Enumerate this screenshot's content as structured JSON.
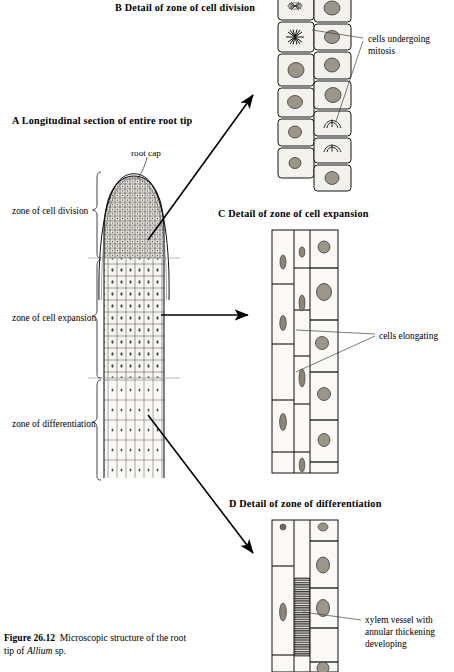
{
  "figure": {
    "caption_label": "Figure 26.12",
    "caption_text": "Microscopic structure of the root",
    "caption_text2": "tip of ",
    "caption_species": "Allium",
    "caption_text3": " sp."
  },
  "panels": {
    "a": {
      "heading": "A  Longitudinal section of entire root tip"
    },
    "b": {
      "heading": "B  Detail of zone of cell division"
    },
    "c": {
      "heading": "C  Detail of zone of cell expansion"
    },
    "d": {
      "heading": "D  Detail of zone of differentiation"
    }
  },
  "labels": {
    "root_cap": "root cap",
    "zone_division": "zone of cell division",
    "zone_expansion": "zone of cell expansion",
    "zone_differentiation": "zone of differentiation",
    "mitosis_line1": "cells undergoing",
    "mitosis_line2": "mitosis",
    "elongating": "cells elongating",
    "xylem_line1": "xylem vessel with",
    "xylem_line2": "annular thickening",
    "xylem_line3": "developing"
  },
  "colors": {
    "ink": "#000000",
    "cell_fill": "#f4f2ec",
    "nucleus": "#8d8578",
    "hatch": "#5a5a5a",
    "leader": "#2b2b2b"
  },
  "diagram": {
    "type": "biological-illustration",
    "zones": [
      {
        "name": "zone of cell division",
        "y_top": 170,
        "y_bottom": 258,
        "description": "dome-shaped apical meristem of small dense isodiametric cells beneath the root cap"
      },
      {
        "name": "zone of cell expansion",
        "y_top": 258,
        "y_bottom": 378,
        "description": "cells in vertical files enlarging along the root axis"
      },
      {
        "name": "zone of differentiation",
        "y_top": 378,
        "y_bottom": 478,
        "description": "elongated cell files differentiating, xylem vessels forming"
      }
    ],
    "panel_b_cells": {
      "columns": 2,
      "left_column_states": [
        "mitosis",
        "mitosis",
        "interphase",
        "interphase",
        "interphase",
        "interphase"
      ],
      "right_column_states": [
        "interphase",
        "interphase",
        "interphase",
        "interphase",
        "mitosis",
        "mitosis",
        "interphase"
      ]
    },
    "panel_c_cells": {
      "columns": 3,
      "cell_shape": "elongated rectangular"
    },
    "panel_d_cells": {
      "columns": 3,
      "feature": "xylem vessel with annular thickening"
    }
  }
}
